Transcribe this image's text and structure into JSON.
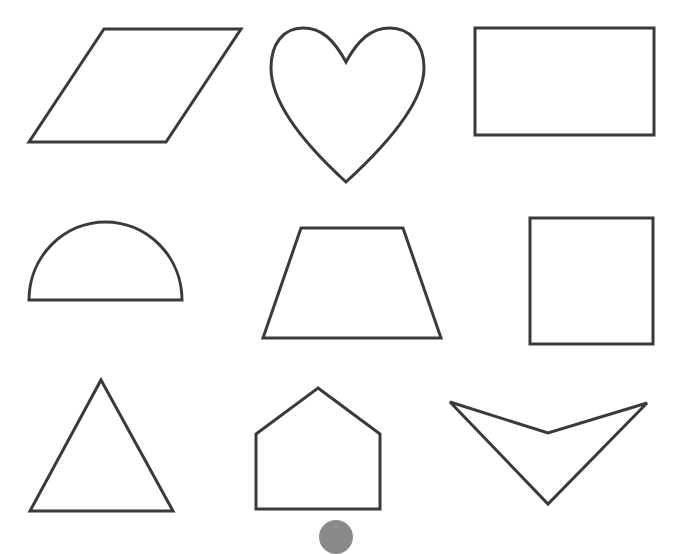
{
  "worksheet": {
    "background": "#ffffff",
    "stroke_color": "#3a3a3a",
    "stroke_width": 3,
    "seal_color": "#8a8a8a"
  },
  "shapes": [
    {
      "name": "parallelogram",
      "row": 1,
      "col": 1,
      "type": "polygon",
      "points": "104,29 241,29 166,142 29,142"
    },
    {
      "name": "heart",
      "row": 1,
      "col": 2,
      "type": "path",
      "d": "M346,62 C334,40 322,28 303,28 C283,28 271,44 271,68 C271,100 300,140 346,182 C392,140 424,100 424,68 C424,44 410,28 390,28 C371,28 358,40 346,62 Z"
    },
    {
      "name": "rectangle",
      "row": 1,
      "col": 3,
      "type": "polygon",
      "points": "475,28 654,28 654,135 475,135"
    },
    {
      "name": "semicircle",
      "row": 2,
      "col": 1,
      "type": "path",
      "d": "M29,300 A76.5,78 0 0 1 182,300 Z"
    },
    {
      "name": "trapezoid",
      "row": 2,
      "col": 2,
      "type": "polygon",
      "points": "301,228 403,228 441,338 263,338"
    },
    {
      "name": "square",
      "row": 2,
      "col": 3,
      "type": "polygon",
      "points": "530,218 653,218 653,344 530,344"
    },
    {
      "name": "triangle",
      "row": 3,
      "col": 1,
      "type": "polygon",
      "points": "101,380 173,511 30,511"
    },
    {
      "name": "pentagon",
      "row": 3,
      "col": 2,
      "type": "polygon",
      "points": "318,388 380,434 380,509 256,509 256,434"
    },
    {
      "name": "concave-kite",
      "row": 3,
      "col": 3,
      "type": "polygon",
      "points": "450,402 548,433 647,403 548,504"
    }
  ]
}
